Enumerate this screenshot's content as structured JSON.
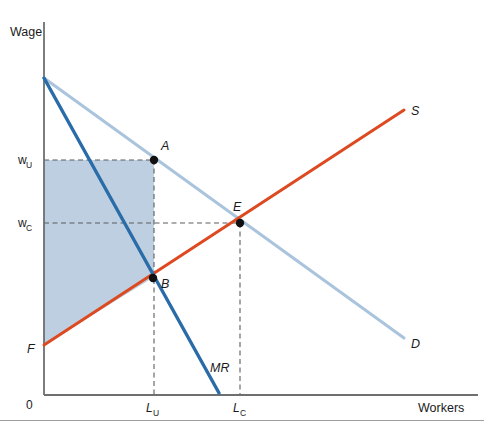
{
  "figure": {
    "background_color": "#ffffff",
    "axis_color": "#6d6f71",
    "bottom_rule_color": "#9b9d9f"
  },
  "axes": {
    "y_title": "Wage",
    "x_title": "Workers",
    "origin_label": "0",
    "x_axis_px": {
      "left": 44,
      "right": 478,
      "y": 395
    },
    "y_axis_px": {
      "x": 44,
      "top": 22,
      "bottom": 395
    }
  },
  "ticks": {
    "y": [
      {
        "base": "w",
        "sub": "U",
        "value_px": 160,
        "label_x": 18
      },
      {
        "base": "w",
        "sub": "C",
        "value_px": 223,
        "label_x": 18
      }
    ],
    "x": [
      {
        "base": "L",
        "sub": "U",
        "value_px": 152,
        "label_y": 412
      },
      {
        "base": "L",
        "sub": "C",
        "value_px": 240,
        "label_y": 412
      }
    ]
  },
  "curves": [
    {
      "name": "demand",
      "label": "D",
      "color": "#a9c4dc",
      "width": 3,
      "x1": 44,
      "y1": 78,
      "x2": 404,
      "y2": 338,
      "label_x": 411,
      "label_y": 348
    },
    {
      "name": "supply",
      "label": "S",
      "color": "#dd4a22",
      "width": 3,
      "x1": 44,
      "y1": 345,
      "x2": 404,
      "y2": 110,
      "label_x": 411,
      "label_y": 115
    },
    {
      "name": "marginal-revenue",
      "label": "MR",
      "color": "#2a6ca8",
      "width": 3.4,
      "x1": 44,
      "y1": 78,
      "x2": 219,
      "y2": 393,
      "label_x": 210,
      "label_y": 372
    }
  ],
  "shaded_region": {
    "name": "union-rent-area",
    "fill": "#bdcfe0",
    "polygon_px": "44,160 154,160 154,277 44,345"
  },
  "points": [
    {
      "id": "A",
      "label": "A",
      "x": 154,
      "y": 160,
      "label_x": 161,
      "label_y": 150
    },
    {
      "id": "B",
      "label": "B",
      "x": 153,
      "y": 278,
      "label_x": 161,
      "label_y": 288
    },
    {
      "id": "E",
      "label": "E",
      "x": 240,
      "y": 223,
      "label_x": 233,
      "label_y": 211
    },
    {
      "id": "F",
      "label": "F",
      "x": 44,
      "y": 345,
      "label_x": 27,
      "label_y": 353
    }
  ],
  "dashed_guides": {
    "color": "#5b5d5f",
    "lines": [
      {
        "name": "w-u-horizontal",
        "x1": 44,
        "y1": 160,
        "x2": 154,
        "y2": 160
      },
      {
        "name": "w-c-horizontal",
        "x1": 44,
        "y1": 223,
        "x2": 240,
        "y2": 223
      },
      {
        "name": "l-u-vertical",
        "x1": 154,
        "y1": 160,
        "x2": 154,
        "y2": 395
      },
      {
        "name": "l-c-vertical",
        "x1": 240,
        "y1": 223,
        "x2": 240,
        "y2": 395
      }
    ]
  }
}
